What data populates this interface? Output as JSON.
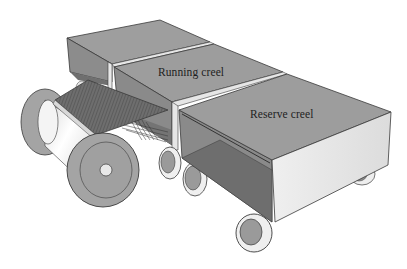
{
  "diagram": {
    "labels": {
      "running_creel": "Running creel",
      "reserve_creel": "Reserve creel"
    },
    "components": [
      {
        "id": "back-creel-box",
        "label": ""
      },
      {
        "id": "running-creel",
        "label": "Running creel"
      },
      {
        "id": "reserve-creel",
        "label": "Reserve creel"
      },
      {
        "id": "warp-beam",
        "label": ""
      },
      {
        "id": "warp-sheet",
        "label": ""
      },
      {
        "id": "trolley-wheels",
        "label": ""
      }
    ],
    "colors": {
      "box_top": "#9d9d9d",
      "box_side_inner": "#8a8a8a",
      "box_floor": "#6f6f6f",
      "box_front_light": "#e6e6e6",
      "edge": "#3a3a3a",
      "flange": "#a4a4a4",
      "barrel": "#f2f2f2",
      "warp_sheet": "#6a6a6a",
      "wheel_tire": "#efefef",
      "background": "#ffffff"
    }
  }
}
